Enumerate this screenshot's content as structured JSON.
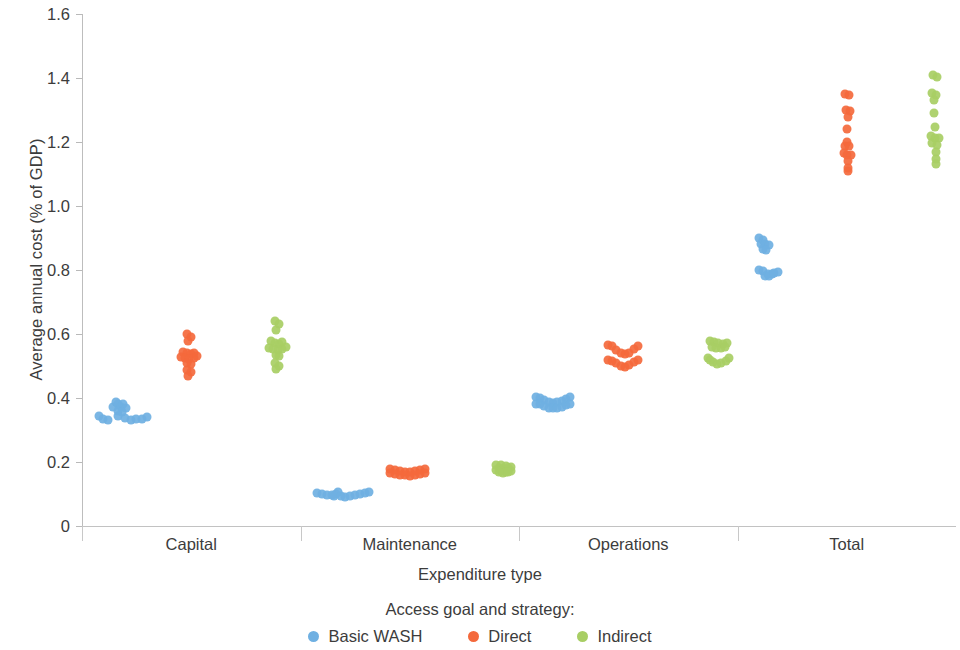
{
  "chart_data": {
    "type": "scatter",
    "title": "",
    "xlabel": "Expenditure type",
    "ylabel": "Average annual cost (% of GDP)",
    "categories": [
      "Capital",
      "Maintenance",
      "Operations",
      "Total"
    ],
    "ylim": [
      0,
      1.6
    ],
    "yticks": [
      0,
      0.2,
      0.4,
      0.6,
      0.8,
      1.0,
      1.2,
      1.4,
      1.6
    ],
    "ytick_labels": [
      "0",
      "0.2",
      "0.4",
      "0.6",
      "0.8",
      "1.0",
      "1.2",
      "1.4",
      "1.6"
    ],
    "grid": false,
    "legend_title": "Access goal and strategy:",
    "legend_position": "bottom",
    "series": [
      {
        "name": "Basic WASH",
        "color": "#6FB0E2",
        "points": {
          "Capital": [
            {
              "jitter": 0.02,
              "value": 0.345
            },
            {
              "jitter": 0.1,
              "value": 0.335
            },
            {
              "jitter": 0.18,
              "value": 0.332
            },
            {
              "jitter": 0.26,
              "value": 0.372
            },
            {
              "jitter": 0.3,
              "value": 0.388
            },
            {
              "jitter": 0.34,
              "value": 0.38
            },
            {
              "jitter": 0.38,
              "value": 0.372
            },
            {
              "jitter": 0.33,
              "value": 0.36
            },
            {
              "jitter": 0.42,
              "value": 0.38
            },
            {
              "jitter": 0.46,
              "value": 0.37
            },
            {
              "jitter": 0.4,
              "value": 0.355
            },
            {
              "jitter": 0.34,
              "value": 0.344
            },
            {
              "jitter": 0.45,
              "value": 0.338
            },
            {
              "jitter": 0.54,
              "value": 0.332
            },
            {
              "jitter": 0.63,
              "value": 0.333
            },
            {
              "jitter": 0.72,
              "value": 0.335
            },
            {
              "jitter": 0.8,
              "value": 0.34
            }
          ],
          "Maintenance": [
            {
              "jitter": 0.02,
              "value": 0.104
            },
            {
              "jitter": 0.1,
              "value": 0.1
            },
            {
              "jitter": 0.18,
              "value": 0.097
            },
            {
              "jitter": 0.26,
              "value": 0.096
            },
            {
              "jitter": 0.32,
              "value": 0.1
            },
            {
              "jitter": 0.36,
              "value": 0.105
            },
            {
              "jitter": 0.3,
              "value": 0.093
            },
            {
              "jitter": 0.4,
              "value": 0.094
            },
            {
              "jitter": 0.48,
              "value": 0.092
            },
            {
              "jitter": 0.56,
              "value": 0.093
            },
            {
              "jitter": 0.64,
              "value": 0.096
            },
            {
              "jitter": 0.72,
              "value": 0.099
            },
            {
              "jitter": 0.8,
              "value": 0.103
            },
            {
              "jitter": 0.86,
              "value": 0.106
            }
          ],
          "Operations": [
            {
              "jitter": 0.02,
              "value": 0.402
            },
            {
              "jitter": 0.09,
              "value": 0.4
            },
            {
              "jitter": 0.16,
              "value": 0.394
            },
            {
              "jitter": 0.23,
              "value": 0.388
            },
            {
              "jitter": 0.3,
              "value": 0.385
            },
            {
              "jitter": 0.37,
              "value": 0.387
            },
            {
              "jitter": 0.44,
              "value": 0.392
            },
            {
              "jitter": 0.51,
              "value": 0.398
            },
            {
              "jitter": 0.58,
              "value": 0.402
            },
            {
              "jitter": 0.02,
              "value": 0.382
            },
            {
              "jitter": 0.09,
              "value": 0.38
            },
            {
              "jitter": 0.16,
              "value": 0.374
            },
            {
              "jitter": 0.23,
              "value": 0.37
            },
            {
              "jitter": 0.3,
              "value": 0.368
            },
            {
              "jitter": 0.37,
              "value": 0.369
            },
            {
              "jitter": 0.44,
              "value": 0.373
            },
            {
              "jitter": 0.51,
              "value": 0.378
            },
            {
              "jitter": 0.58,
              "value": 0.382
            }
          ],
          "Total": [
            {
              "jitter": 0.1,
              "value": 0.9
            },
            {
              "jitter": 0.17,
              "value": 0.895
            },
            {
              "jitter": 0.13,
              "value": 0.882
            },
            {
              "jitter": 0.2,
              "value": 0.88
            },
            {
              "jitter": 0.27,
              "value": 0.878
            },
            {
              "jitter": 0.16,
              "value": 0.866
            },
            {
              "jitter": 0.22,
              "value": 0.862
            },
            {
              "jitter": 0.1,
              "value": 0.8
            },
            {
              "jitter": 0.17,
              "value": 0.796
            },
            {
              "jitter": 0.24,
              "value": 0.789
            },
            {
              "jitter": 0.31,
              "value": 0.788
            },
            {
              "jitter": 0.19,
              "value": 0.782
            },
            {
              "jitter": 0.26,
              "value": 0.78
            },
            {
              "jitter": 0.35,
              "value": 0.792
            },
            {
              "jitter": 0.41,
              "value": 0.793
            }
          ]
        }
      },
      {
        "name": "Direct",
        "color": "#F4693C",
        "points": {
          "Capital": [
            {
              "jitter": 0.36,
              "value": 0.6
            },
            {
              "jitter": 0.42,
              "value": 0.592
            },
            {
              "jitter": 0.38,
              "value": 0.578
            },
            {
              "jitter": 0.3,
              "value": 0.545
            },
            {
              "jitter": 0.36,
              "value": 0.54
            },
            {
              "jitter": 0.42,
              "value": 0.538
            },
            {
              "jitter": 0.48,
              "value": 0.54
            },
            {
              "jitter": 0.26,
              "value": 0.528
            },
            {
              "jitter": 0.33,
              "value": 0.524
            },
            {
              "jitter": 0.4,
              "value": 0.522
            },
            {
              "jitter": 0.47,
              "value": 0.525
            },
            {
              "jitter": 0.53,
              "value": 0.53
            },
            {
              "jitter": 0.37,
              "value": 0.508
            },
            {
              "jitter": 0.43,
              "value": 0.505
            },
            {
              "jitter": 0.36,
              "value": 0.488
            },
            {
              "jitter": 0.42,
              "value": 0.482
            },
            {
              "jitter": 0.38,
              "value": 0.47
            }
          ],
          "Maintenance": [
            {
              "jitter": 0.12,
              "value": 0.178
            },
            {
              "jitter": 0.2,
              "value": 0.176
            },
            {
              "jitter": 0.28,
              "value": 0.172
            },
            {
              "jitter": 0.36,
              "value": 0.17
            },
            {
              "jitter": 0.44,
              "value": 0.169
            },
            {
              "jitter": 0.52,
              "value": 0.171
            },
            {
              "jitter": 0.6,
              "value": 0.174
            },
            {
              "jitter": 0.68,
              "value": 0.177
            },
            {
              "jitter": 0.12,
              "value": 0.166
            },
            {
              "jitter": 0.2,
              "value": 0.164
            },
            {
              "jitter": 0.28,
              "value": 0.16
            },
            {
              "jitter": 0.36,
              "value": 0.158
            },
            {
              "jitter": 0.44,
              "value": 0.157
            },
            {
              "jitter": 0.52,
              "value": 0.159
            },
            {
              "jitter": 0.6,
              "value": 0.162
            },
            {
              "jitter": 0.68,
              "value": 0.165
            }
          ],
          "Operations": [
            {
              "jitter": 0.1,
              "value": 0.565
            },
            {
              "jitter": 0.17,
              "value": 0.562
            },
            {
              "jitter": 0.24,
              "value": 0.55
            },
            {
              "jitter": 0.31,
              "value": 0.54
            },
            {
              "jitter": 0.38,
              "value": 0.537
            },
            {
              "jitter": 0.45,
              "value": 0.542
            },
            {
              "jitter": 0.52,
              "value": 0.554
            },
            {
              "jitter": 0.59,
              "value": 0.562
            },
            {
              "jitter": 0.1,
              "value": 0.52
            },
            {
              "jitter": 0.17,
              "value": 0.517
            },
            {
              "jitter": 0.24,
              "value": 0.508
            },
            {
              "jitter": 0.31,
              "value": 0.5
            },
            {
              "jitter": 0.38,
              "value": 0.498
            },
            {
              "jitter": 0.45,
              "value": 0.503
            },
            {
              "jitter": 0.52,
              "value": 0.512
            },
            {
              "jitter": 0.59,
              "value": 0.519
            }
          ],
          "Total": [
            {
              "jitter": 0.4,
              "value": 1.35
            },
            {
              "jitter": 0.47,
              "value": 1.348
            },
            {
              "jitter": 0.42,
              "value": 1.3
            },
            {
              "jitter": 0.49,
              "value": 1.296
            },
            {
              "jitter": 0.46,
              "value": 1.278
            },
            {
              "jitter": 0.44,
              "value": 1.24
            },
            {
              "jitter": 0.44,
              "value": 1.2
            },
            {
              "jitter": 0.4,
              "value": 1.188
            },
            {
              "jitter": 0.47,
              "value": 1.186
            },
            {
              "jitter": 0.38,
              "value": 1.165
            },
            {
              "jitter": 0.44,
              "value": 1.16
            },
            {
              "jitter": 0.5,
              "value": 1.158
            },
            {
              "jitter": 0.46,
              "value": 1.14
            },
            {
              "jitter": 0.46,
              "value": 1.12
            },
            {
              "jitter": 0.46,
              "value": 1.108
            }
          ]
        }
      },
      {
        "name": "Indirect",
        "color": "#A8CE64",
        "points": {
          "Capital": [
            {
              "jitter": 0.7,
              "value": 0.64
            },
            {
              "jitter": 0.76,
              "value": 0.63
            },
            {
              "jitter": 0.72,
              "value": 0.612
            },
            {
              "jitter": 0.64,
              "value": 0.578
            },
            {
              "jitter": 0.7,
              "value": 0.572
            },
            {
              "jitter": 0.76,
              "value": 0.57
            },
            {
              "jitter": 0.82,
              "value": 0.574
            },
            {
              "jitter": 0.6,
              "value": 0.556
            },
            {
              "jitter": 0.67,
              "value": 0.552
            },
            {
              "jitter": 0.74,
              "value": 0.55
            },
            {
              "jitter": 0.81,
              "value": 0.553
            },
            {
              "jitter": 0.87,
              "value": 0.558
            },
            {
              "jitter": 0.71,
              "value": 0.534
            },
            {
              "jitter": 0.77,
              "value": 0.53
            },
            {
              "jitter": 0.7,
              "value": 0.508
            },
            {
              "jitter": 0.76,
              "value": 0.5
            },
            {
              "jitter": 0.72,
              "value": 0.49
            }
          ],
          "Maintenance": [
            {
              "jitter": 0.74,
              "value": 0.192
            },
            {
              "jitter": 0.82,
              "value": 0.19
            },
            {
              "jitter": 0.9,
              "value": 0.186
            },
            {
              "jitter": 0.98,
              "value": 0.184
            },
            {
              "jitter": 0.78,
              "value": 0.18
            },
            {
              "jitter": 0.86,
              "value": 0.178
            },
            {
              "jitter": 0.94,
              "value": 0.18
            },
            {
              "jitter": 0.74,
              "value": 0.176
            },
            {
              "jitter": 0.82,
              "value": 0.172
            },
            {
              "jitter": 0.9,
              "value": 0.17
            },
            {
              "jitter": 0.98,
              "value": 0.173
            },
            {
              "jitter": 0.78,
              "value": 0.168
            },
            {
              "jitter": 0.86,
              "value": 0.166
            },
            {
              "jitter": 0.94,
              "value": 0.169
            }
          ],
          "Operations": [
            {
              "jitter": 0.66,
              "value": 0.578
            },
            {
              "jitter": 0.73,
              "value": 0.576
            },
            {
              "jitter": 0.8,
              "value": 0.572
            },
            {
              "jitter": 0.87,
              "value": 0.57
            },
            {
              "jitter": 0.94,
              "value": 0.572
            },
            {
              "jitter": 0.7,
              "value": 0.56
            },
            {
              "jitter": 0.77,
              "value": 0.556
            },
            {
              "jitter": 0.84,
              "value": 0.555
            },
            {
              "jitter": 0.91,
              "value": 0.558
            },
            {
              "jitter": 0.64,
              "value": 0.524
            },
            {
              "jitter": 0.71,
              "value": 0.512
            },
            {
              "jitter": 0.78,
              "value": 0.506
            },
            {
              "jitter": 0.85,
              "value": 0.508
            },
            {
              "jitter": 0.92,
              "value": 0.516
            },
            {
              "jitter": 0.98,
              "value": 0.524
            },
            {
              "jitter": 0.66,
              "value": 0.518
            }
          ],
          "Total": [
            {
              "jitter": 0.74,
              "value": 1.408
            },
            {
              "jitter": 0.8,
              "value": 1.402
            },
            {
              "jitter": 0.72,
              "value": 1.352
            },
            {
              "jitter": 0.79,
              "value": 1.348
            },
            {
              "jitter": 0.75,
              "value": 1.33
            },
            {
              "jitter": 0.76,
              "value": 1.29
            },
            {
              "jitter": 0.77,
              "value": 1.248
            },
            {
              "jitter": 0.7,
              "value": 1.218
            },
            {
              "jitter": 0.77,
              "value": 1.214
            },
            {
              "jitter": 0.84,
              "value": 1.212
            },
            {
              "jitter": 0.73,
              "value": 1.196
            },
            {
              "jitter": 0.8,
              "value": 1.192
            },
            {
              "jitter": 0.78,
              "value": 1.168
            },
            {
              "jitter": 0.78,
              "value": 1.148
            },
            {
              "jitter": 0.78,
              "value": 1.132
            }
          ]
        }
      }
    ]
  }
}
